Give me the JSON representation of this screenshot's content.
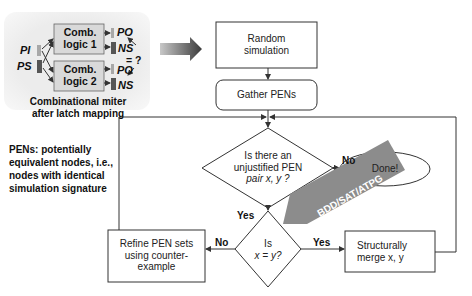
{
  "miter": {
    "block1": [
      "Comb.",
      "logic 1"
    ],
    "block2": [
      "Comb.",
      "logic 2"
    ],
    "inputs": {
      "pi": "PI",
      "ps": "PS"
    },
    "outputs1": {
      "po": "PO",
      "ns": "NS"
    },
    "outputs2": {
      "po": "PO",
      "ns": "NS"
    },
    "compare": "= ?",
    "caption": [
      "Combinational miter",
      "after latch mapping"
    ]
  },
  "definition": [
    "PENs: potentially",
    "equivalent nodes, i.e.,",
    "nodes with identical",
    "simulation signature"
  ],
  "flow": {
    "random_sim": [
      "Random",
      "simulation"
    ],
    "gather": "Gather PENs",
    "decision1": [
      "Is there an",
      "unjustified PEN",
      "pair x, y ?"
    ],
    "no1": "No",
    "done": "Done!",
    "yes1": "Yes",
    "decision2": [
      "Is",
      "x = y?"
    ],
    "no2": "No",
    "yes2": "Yes",
    "refine": [
      "Refine PEN sets",
      "using counter-",
      "example"
    ],
    "merge": [
      "Structurally",
      "merge x, y"
    ],
    "engines": "BDD/SAT/ATPG"
  },
  "colors": {
    "panel_bg": "#ededed",
    "block_fill": "#d9d9d9",
    "banner": "#8c8c8c",
    "line": "#333333"
  }
}
